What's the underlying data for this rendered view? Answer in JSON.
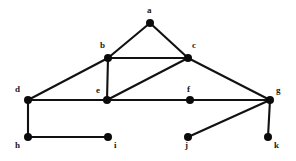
{
  "figure": {
    "kind": "undirected-graph-diagram",
    "width": 296,
    "height": 161,
    "background_color": "#ffffff",
    "edge_color": "#111111",
    "vertex_color": "#0b0b0b",
    "label_color": "#1a1a1a",
    "vertex_radius": 4,
    "edge_width": 2.1
  },
  "graph": {
    "vertex_count": 11,
    "edge_count": 14,
    "vertices": [
      {
        "id": "a",
        "label": "a",
        "x": 150,
        "y": 23,
        "label_x": 147,
        "label_y": 6,
        "degree": 2
      },
      {
        "id": "b",
        "label": "b",
        "x": 108,
        "y": 58,
        "label_x": 100,
        "label_y": 41,
        "degree": 4
      },
      {
        "id": "c",
        "label": "c",
        "x": 188,
        "y": 58,
        "label_x": 192,
        "label_y": 41,
        "degree": 4
      },
      {
        "id": "d",
        "label": "d",
        "x": 28,
        "y": 100,
        "label_x": 15,
        "label_y": 85,
        "degree": 3
      },
      {
        "id": "e",
        "label": "e",
        "x": 107,
        "y": 100,
        "label_x": 96,
        "label_y": 86,
        "degree": 4
      },
      {
        "id": "f",
        "label": "f",
        "x": 190,
        "y": 100,
        "label_x": 187,
        "label_y": 85,
        "degree": 2
      },
      {
        "id": "g",
        "label": "g",
        "x": 270,
        "y": 100,
        "label_x": 276,
        "label_y": 86,
        "degree": 4
      },
      {
        "id": "h",
        "label": "h",
        "x": 28,
        "y": 137,
        "label_x": 15,
        "label_y": 141,
        "degree": 2
      },
      {
        "id": "i",
        "label": "i",
        "x": 108,
        "y": 137,
        "label_x": 114,
        "label_y": 141,
        "degree": 1
      },
      {
        "id": "j",
        "label": "j",
        "x": 188,
        "y": 137,
        "label_x": 185,
        "label_y": 141,
        "degree": 1
      },
      {
        "id": "k",
        "label": "k",
        "x": 268,
        "y": 137,
        "label_x": 274,
        "label_y": 141,
        "degree": 1
      }
    ],
    "edges": [
      {
        "id": "a-b",
        "from": "a",
        "to": "b"
      },
      {
        "id": "a-c",
        "from": "a",
        "to": "c"
      },
      {
        "id": "b-c",
        "from": "b",
        "to": "c"
      },
      {
        "id": "b-d",
        "from": "b",
        "to": "d"
      },
      {
        "id": "b-e",
        "from": "b",
        "to": "e"
      },
      {
        "id": "c-e",
        "from": "c",
        "to": "e"
      },
      {
        "id": "c-g",
        "from": "c",
        "to": "g"
      },
      {
        "id": "d-e",
        "from": "d",
        "to": "e"
      },
      {
        "id": "d-h",
        "from": "d",
        "to": "h"
      },
      {
        "id": "e-f",
        "from": "e",
        "to": "f"
      },
      {
        "id": "f-g",
        "from": "f",
        "to": "g"
      },
      {
        "id": "g-j",
        "from": "g",
        "to": "j"
      },
      {
        "id": "g-k",
        "from": "g",
        "to": "k"
      },
      {
        "id": "h-i",
        "from": "h",
        "to": "i"
      }
    ]
  }
}
